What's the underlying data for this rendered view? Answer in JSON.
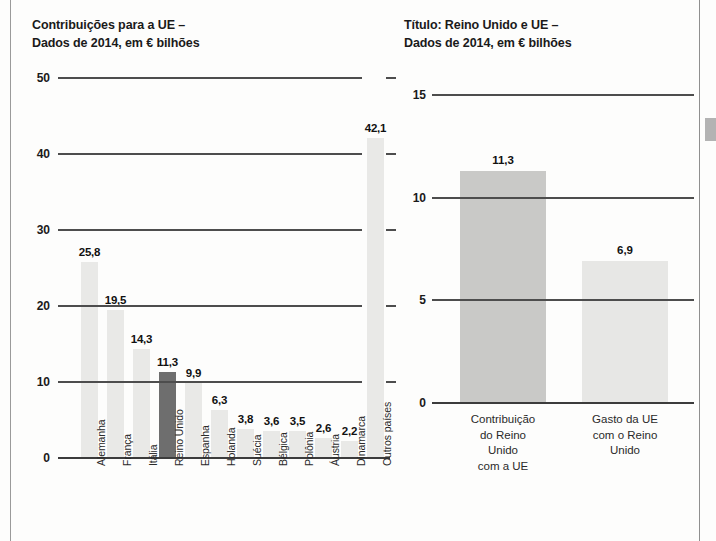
{
  "figure": {
    "left_chart": {
      "title": "Contribuições para a UE –\nDados de 2014, em € bilhões"
    },
    "right_chart": {
      "title": "Título: Reino Unido e UE –\nDados de 2014, em € bilhões"
    }
  },
  "chart_data": [
    {
      "type": "bar",
      "id": "contribuicoes-ue",
      "title": "Contribuições para a UE – Dados de 2014, em € bilhões",
      "xlabel": "",
      "ylabel": "",
      "ylim": [
        0,
        50
      ],
      "yticks": [
        "0",
        "10",
        "20",
        "30",
        "40",
        "50"
      ],
      "ytick_values": [
        0,
        10,
        20,
        30,
        40,
        50
      ],
      "grid": true,
      "legend": "none",
      "highlight_category": "Reino Unido",
      "categories": [
        "Alemanha",
        "França",
        "Itália",
        "Reino Unido",
        "Espanha",
        "Holanda",
        "Suécia",
        "Bélgica",
        "Polônia",
        "Áustria",
        "Dinamarca",
        "Outros países"
      ],
      "values": [
        25.8,
        19.5,
        14.3,
        11.3,
        9.9,
        6.3,
        3.8,
        3.6,
        3.5,
        2.6,
        2.2,
        42.1
      ],
      "value_labels": [
        "25,8",
        "19,5",
        "14,3",
        "11,3",
        "9,9",
        "6,3",
        "3,8",
        "3,6",
        "3,5",
        "2,6",
        "2,2",
        "42,1"
      ]
    },
    {
      "type": "bar",
      "id": "reino-unido-e-ue",
      "title": "Título: Reino Unido e UE – Dados de 2014, em € bilhões",
      "xlabel": "",
      "ylabel": "",
      "ylim": [
        0,
        15
      ],
      "yticks": [
        "0",
        "5",
        "10",
        "15"
      ],
      "ytick_values": [
        0,
        5,
        10,
        15
      ],
      "grid": true,
      "legend": "none",
      "categories": [
        "Contribuição\ndo Reino\nUnido\ncom a UE",
        "Gasto da UE\ncom o Reino\nUnido"
      ],
      "values": [
        11.3,
        6.9
      ],
      "value_labels": [
        "11,3",
        "6,9"
      ]
    }
  ]
}
